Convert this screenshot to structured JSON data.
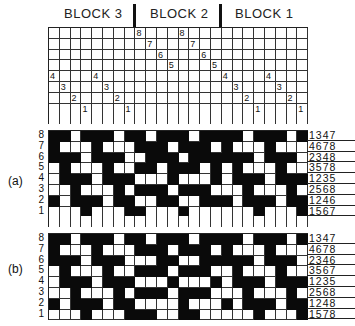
{
  "blocks": [
    {
      "label": "BLOCK 3"
    },
    {
      "label": "BLOCK 2"
    },
    {
      "label": "BLOCK 1"
    }
  ],
  "threading": {
    "columns": 24,
    "rows": 8,
    "shaft_per_column": [
      4,
      3,
      2,
      1,
      4,
      3,
      2,
      1,
      8,
      7,
      6,
      5,
      8,
      7,
      6,
      5,
      4,
      3,
      2,
      1,
      4,
      3,
      2,
      1
    ]
  },
  "drawdowns": [
    {
      "label": "(a)",
      "row_numbers": [
        "8",
        "7",
        "6",
        "5",
        "4",
        "3",
        "2",
        "1"
      ],
      "tieup": [
        "1347",
        "4678",
        "2348",
        "3578",
        "1235",
        "2568",
        "1246",
        "1567"
      ],
      "cells": [
        [
          1,
          1,
          0,
          1,
          1,
          1,
          0,
          1,
          1,
          0,
          1,
          1,
          1,
          0,
          1,
          1,
          1,
          1,
          0,
          1,
          1,
          1,
          0,
          1
        ],
        [
          1,
          0,
          0,
          0,
          1,
          0,
          0,
          0,
          1,
          1,
          1,
          0,
          1,
          1,
          1,
          0,
          1,
          0,
          0,
          0,
          1,
          0,
          0,
          0
        ],
        [
          1,
          1,
          1,
          0,
          1,
          1,
          1,
          0,
          0,
          1,
          1,
          1,
          0,
          1,
          1,
          1,
          1,
          1,
          1,
          0,
          1,
          1,
          1,
          0
        ],
        [
          0,
          1,
          0,
          0,
          0,
          1,
          0,
          0,
          1,
          1,
          0,
          1,
          1,
          1,
          0,
          1,
          0,
          1,
          0,
          0,
          0,
          1,
          0,
          0
        ],
        [
          0,
          1,
          1,
          1,
          0,
          1,
          1,
          1,
          0,
          0,
          0,
          1,
          0,
          0,
          0,
          1,
          0,
          1,
          1,
          1,
          0,
          1,
          1,
          1
        ],
        [
          0,
          0,
          1,
          0,
          0,
          0,
          1,
          0,
          1,
          1,
          1,
          0,
          1,
          1,
          1,
          0,
          0,
          0,
          1,
          0,
          0,
          0,
          1,
          0
        ],
        [
          1,
          0,
          1,
          1,
          1,
          0,
          1,
          1,
          0,
          0,
          1,
          1,
          0,
          0,
          1,
          1,
          1,
          0,
          1,
          1,
          1,
          0,
          1,
          1
        ],
        [
          0,
          0,
          0,
          1,
          0,
          0,
          0,
          1,
          1,
          0,
          0,
          0,
          1,
          0,
          0,
          0,
          0,
          0,
          0,
          1,
          0,
          0,
          0,
          1
        ]
      ]
    },
    {
      "label": "(b)",
      "row_numbers": [
        "8",
        "7",
        "6",
        "5",
        "4",
        "3",
        "2",
        "1"
      ],
      "tieup": [
        "1347",
        "4678",
        "2346",
        "3567",
        "1235",
        "2568",
        "1248",
        "1578"
      ],
      "cells": [
        [
          1,
          1,
          0,
          1,
          1,
          1,
          0,
          1,
          1,
          0,
          1,
          1,
          1,
          0,
          1,
          1,
          1,
          1,
          0,
          1,
          1,
          1,
          0,
          1
        ],
        [
          1,
          0,
          0,
          0,
          1,
          0,
          0,
          0,
          1,
          1,
          1,
          0,
          1,
          1,
          1,
          0,
          1,
          0,
          0,
          0,
          1,
          0,
          0,
          0
        ],
        [
          1,
          1,
          1,
          0,
          1,
          1,
          1,
          0,
          0,
          0,
          1,
          1,
          0,
          0,
          1,
          1,
          1,
          1,
          1,
          0,
          1,
          1,
          1,
          0
        ],
        [
          0,
          1,
          0,
          0,
          0,
          1,
          0,
          0,
          1,
          1,
          1,
          0,
          1,
          1,
          1,
          0,
          0,
          1,
          0,
          0,
          0,
          1,
          0,
          0
        ],
        [
          0,
          1,
          1,
          1,
          0,
          1,
          1,
          1,
          0,
          0,
          0,
          1,
          0,
          0,
          0,
          1,
          0,
          1,
          1,
          1,
          0,
          1,
          1,
          1
        ],
        [
          0,
          0,
          1,
          0,
          0,
          0,
          1,
          0,
          1,
          1,
          1,
          0,
          1,
          1,
          1,
          0,
          0,
          0,
          1,
          0,
          0,
          0,
          1,
          0
        ],
        [
          1,
          0,
          1,
          1,
          1,
          0,
          1,
          1,
          0,
          0,
          0,
          0,
          1,
          0,
          0,
          0,
          1,
          0,
          1,
          1,
          1,
          0,
          1,
          1
        ],
        [
          0,
          0,
          0,
          1,
          0,
          0,
          0,
          1,
          1,
          1,
          0,
          0,
          1,
          1,
          0,
          0,
          0,
          0,
          0,
          1,
          0,
          0,
          0,
          1
        ]
      ]
    }
  ]
}
